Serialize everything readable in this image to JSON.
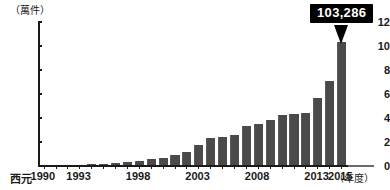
{
  "chart_data": {
    "type": "bar",
    "title": "",
    "subtitle": "",
    "unit_label": "（萬件）",
    "xlabel": "（年度）",
    "ylabel": "",
    "x_prefix": "西元",
    "ylim": [
      0,
      12
    ],
    "y_ticks": [
      0,
      2,
      4,
      6,
      8,
      10,
      12
    ],
    "y_tick_labels": [
      "0",
      "2",
      "4",
      "6",
      "8",
      "10",
      "12"
    ],
    "grid": false,
    "legend": null,
    "categories": [
      "1990",
      "1991",
      "1992",
      "1993",
      "1994",
      "1995",
      "1996",
      "1997",
      "1998",
      "1999",
      "2000",
      "2001",
      "2002",
      "2003",
      "2004",
      "2005",
      "2006",
      "2007",
      "2008",
      "2009",
      "2010",
      "2011",
      "2012",
      "2013",
      "2014",
      "2015"
    ],
    "values": [
      0.08,
      0.09,
      0.1,
      0.12,
      0.14,
      0.18,
      0.26,
      0.33,
      0.42,
      0.55,
      0.7,
      0.95,
      1.2,
      1.75,
      2.35,
      2.4,
      2.6,
      3.35,
      3.5,
      3.85,
      4.25,
      4.35,
      4.45,
      5.7,
      7.1,
      10.33
    ],
    "x_tick_labels": [
      {
        "year": "1990",
        "text": "1990"
      },
      {
        "year": "1993",
        "text": "1993"
      },
      {
        "year": "1998",
        "text": "1998"
      },
      {
        "year": "2003",
        "text": "2003"
      },
      {
        "year": "2008",
        "text": "2008"
      },
      {
        "year": "2013",
        "text": "2013"
      },
      {
        "year": "2015",
        "text": "2015"
      }
    ],
    "annotations": [
      {
        "label": "103,286",
        "category": "2015",
        "value": 10.33,
        "style": "callout-box-black"
      }
    ],
    "colors": {
      "bar": "#4a4a4a",
      "axis": "#1a1a1a",
      "callout_bg": "#000000",
      "callout_text": "#ffffff",
      "background": "#ffffff"
    }
  }
}
